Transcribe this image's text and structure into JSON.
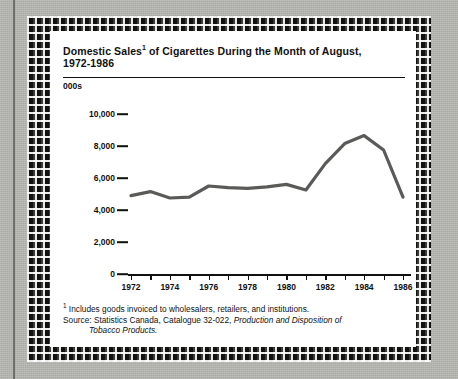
{
  "figure": {
    "title_line1": "Domestic Sales",
    "title_footnote_marker": "1",
    "title_line1_cont": " of Cigarettes During the Month of August,",
    "title_line2": "1972-1986",
    "units_label": "000s",
    "notes": {
      "footnote_marker": "1",
      "footnote_text": " Includes goods invoiced to wholesalers, retailers, and institutions.",
      "source_prefix": "Source: Statistics Canada, Catalogue 32-022, ",
      "source_title": "Production and Disposition of",
      "source_title_cont": "Tobacco Products."
    }
  },
  "chart_data": {
    "type": "line",
    "xlabel": "",
    "ylabel": "000s",
    "ylim": [
      0,
      10000
    ],
    "yticks": [
      0,
      2000,
      4000,
      6000,
      8000,
      10000
    ],
    "ytick_labels": [
      "0",
      "2,000",
      "4,000",
      "6,000",
      "8,000",
      "10,000"
    ],
    "xlim": [
      1972,
      1986
    ],
    "xticks": [
      1972,
      1973,
      1974,
      1975,
      1976,
      1977,
      1978,
      1979,
      1980,
      1981,
      1982,
      1983,
      1984,
      1985,
      1986
    ],
    "xtick_labels": [
      "1972",
      "",
      "1974",
      "",
      "1976",
      "",
      "1978",
      "",
      "1980",
      "",
      "1982",
      "",
      "1984",
      "",
      "1986"
    ],
    "grid": false,
    "legend": false,
    "line_color": "#5a5a58",
    "x": [
      1972,
      1973,
      1974,
      1975,
      1976,
      1977,
      1978,
      1979,
      1980,
      1981,
      1982,
      1983,
      1984,
      1985,
      1986
    ],
    "values": [
      4900,
      5150,
      4750,
      4800,
      5500,
      5400,
      5350,
      5450,
      5600,
      5250,
      6900,
      8150,
      8650,
      7750,
      4800
    ]
  }
}
